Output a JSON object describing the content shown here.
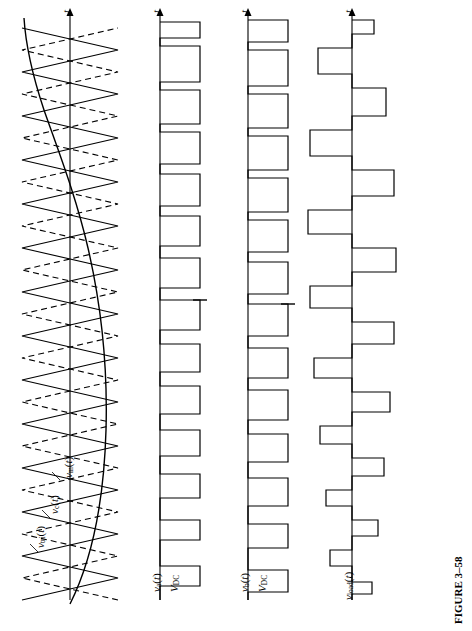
{
  "figure": {
    "caption": "FIGURE 3–58",
    "orientation": "rotated-90-ccw",
    "background": "#ffffff",
    "line_color": "#000000"
  },
  "panels": [
    {
      "id": "panel-1",
      "name": "carrier-and-control-waveforms",
      "labels": [
        {
          "key": "v_tri",
          "text": "vₜᵣᵢ(t)",
          "plain": "v_tri(t)"
        },
        {
          "key": "v_c",
          "text": "vᶜ(t)",
          "plain": "v_c(t)"
        },
        {
          "key": "v_m",
          "text": "vₘ(t)",
          "plain": "v_m(t)"
        },
        {
          "key": "t_axis",
          "text": "t"
        }
      ],
      "content": "Two interleaved triangular carrier waveforms (one solid, one dashed) plus a sinusoidal modulating signal"
    },
    {
      "id": "panel-2",
      "name": "inverter-leg-a-voltage",
      "labels": [
        {
          "key": "v_a",
          "text": "vₐ(t)",
          "plain": "v_a(t)"
        },
        {
          "key": "v_dc",
          "text": "Vᴅᴄ",
          "plain": "V_DC"
        },
        {
          "key": "t_axis",
          "text": "t"
        }
      ],
      "content": "Two-level PWM switched square waveform between 0 and V_DC"
    },
    {
      "id": "panel-3",
      "name": "inverter-leg-b-voltage",
      "labels": [
        {
          "key": "v_b",
          "text": "vᵇ(t)",
          "plain": "v_b(t)"
        },
        {
          "key": "v_dc",
          "text": "Vᴅᴄ",
          "plain": "V_DC"
        },
        {
          "key": "t_axis",
          "text": "t"
        }
      ],
      "content": "Two-level PWM switched square waveform between 0 and V_DC, phase shifted from leg a"
    },
    {
      "id": "panel-4",
      "name": "load-voltage",
      "labels": [
        {
          "key": "v_load",
          "text": "vₗₒₐᴅ(t)",
          "plain": "v_load(t)"
        },
        {
          "key": "t_axis",
          "text": "t"
        }
      ],
      "content": "Bipolar three-level difference waveform v_a(t) - v_b(t)"
    }
  ],
  "axis_tick": "t"
}
